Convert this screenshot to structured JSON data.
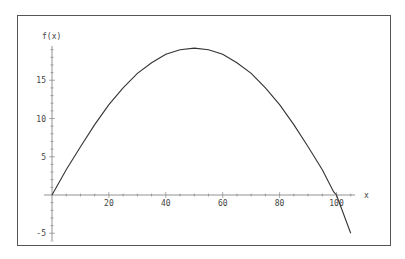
{
  "chart_data": {
    "type": "line",
    "title": "",
    "xlabel": "x",
    "ylabel": "f(x)",
    "xlim": [
      0,
      106
    ],
    "ylim": [
      -6,
      20
    ],
    "x_ticks": [
      20,
      40,
      60,
      80,
      100
    ],
    "y_ticks": [
      -5,
      5,
      10,
      15
    ],
    "grid": false,
    "legend": null,
    "series": [
      {
        "name": "f(x)",
        "x": [
          0,
          5,
          10,
          15,
          20,
          25,
          30,
          35,
          40,
          45,
          50,
          55,
          60,
          65,
          70,
          75,
          80,
          85,
          90,
          95,
          99,
          100,
          105
        ],
        "y": [
          0,
          3.3,
          6.3,
          9.2,
          11.8,
          14.0,
          15.9,
          17.3,
          18.4,
          19.0,
          19.2,
          19.0,
          18.4,
          17.3,
          15.9,
          14.0,
          11.8,
          9.2,
          6.3,
          3.3,
          0.4,
          0,
          -5.0
        ]
      }
    ]
  }
}
